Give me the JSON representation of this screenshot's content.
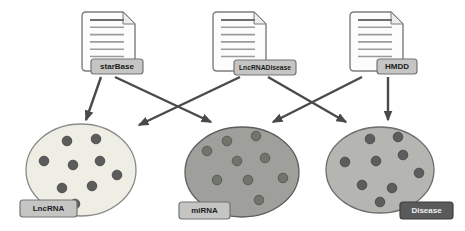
{
  "palette": {
    "background": "#ffffff",
    "arrow": "#4a4a4a",
    "doc_fill": "#fcfcfc",
    "doc_border": "#7d7d7d",
    "doc_fold_fill": "#ececec",
    "doc_line": "#9c9c9c",
    "doc_title_line": "#6f6f6f",
    "tag_light_fill": "#c5c5c3",
    "tag_light_border": "#757575",
    "tag_light_text": "#1c1c1c",
    "tag_dark_fill": "#5a5a5a",
    "tag_dark_border": "#3d3d3d",
    "tag_dark_text": "#f0f0f0"
  },
  "sources": [
    {
      "id": "starbase",
      "label": "starBase",
      "icon": "document",
      "doc": {
        "x": 82,
        "y": 12,
        "w": 53,
        "h": 59
      },
      "tag": {
        "x": 91,
        "y": 59,
        "w": 52,
        "h": 15
      }
    },
    {
      "id": "lncrnadisease",
      "label": "LncRNADisease",
      "icon": "document",
      "doc": {
        "x": 213,
        "y": 12,
        "w": 53,
        "h": 59
      },
      "tag": {
        "x": 234,
        "y": 60,
        "w": 62,
        "h": 15
      }
    },
    {
      "id": "hmdd",
      "label": "HMDD",
      "icon": "document",
      "doc": {
        "x": 350,
        "y": 12,
        "w": 53,
        "h": 59
      },
      "tag": {
        "x": 377,
        "y": 59,
        "w": 40,
        "h": 15
      }
    }
  ],
  "sets": [
    {
      "id": "lncrna",
      "label": "LncRNA",
      "tag_style": "light",
      "cx": 81,
      "cy": 170,
      "rx": 55,
      "ry": 46,
      "fill": "#efeee5",
      "stroke": "#8a8a8a",
      "dot_fill": "#5c5c5c",
      "dot_stroke": "#484848",
      "dots": [
        [
          67,
          141
        ],
        [
          96,
          139
        ],
        [
          44,
          161
        ],
        [
          73,
          165
        ],
        [
          100,
          161
        ],
        [
          117,
          175
        ],
        [
          62,
          188
        ],
        [
          92,
          186
        ],
        [
          75,
          204
        ]
      ],
      "tag": {
        "x": 20,
        "y": 200,
        "w": 57,
        "h": 17
      }
    },
    {
      "id": "mirna",
      "label": "miRNA",
      "tag_style": "light",
      "cx": 242,
      "cy": 172,
      "rx": 57,
      "ry": 45,
      "fill": "#9f9f9b",
      "stroke": "#5d5d5d",
      "dot_fill": "#70746a",
      "dot_stroke": "#545a50",
      "dots": [
        [
          227,
          141
        ],
        [
          256,
          136
        ],
        [
          207,
          151
        ],
        [
          237,
          161
        ],
        [
          265,
          158
        ],
        [
          217,
          180
        ],
        [
          248,
          180
        ],
        [
          283,
          178
        ],
        [
          259,
          200
        ]
      ],
      "tag": {
        "x": 179,
        "y": 202,
        "w": 51,
        "h": 17
      }
    },
    {
      "id": "disease",
      "label": "Disease",
      "tag_style": "dark",
      "cx": 380,
      "cy": 170,
      "rx": 54,
      "ry": 43,
      "fill": "#b5b5b2",
      "stroke": "#6d6d6d",
      "dot_fill": "#5d5d5d",
      "dot_stroke": "#484848",
      "dots": [
        [
          370,
          139
        ],
        [
          398,
          137
        ],
        [
          345,
          162
        ],
        [
          376,
          161
        ],
        [
          403,
          155
        ],
        [
          419,
          173
        ],
        [
          362,
          185
        ],
        [
          392,
          188
        ],
        [
          380,
          202
        ]
      ],
      "tag": {
        "x": 400,
        "y": 202,
        "w": 53,
        "h": 17
      }
    }
  ],
  "arrows": [
    {
      "id": "starbase-to-lncrna",
      "from": [
        101,
        77
      ],
      "to": [
        86,
        120
      ]
    },
    {
      "id": "starbase-to-mirna",
      "from": [
        115,
        77
      ],
      "to": [
        211,
        122
      ]
    },
    {
      "id": "lncrnadisease-to-lncrna",
      "from": [
        240,
        77
      ],
      "to": [
        139,
        125
      ]
    },
    {
      "id": "lncrnadisease-to-disease",
      "from": [
        268,
        77
      ],
      "to": [
        346,
        122
      ]
    },
    {
      "id": "hmdd-to-mirna",
      "from": [
        362,
        77
      ],
      "to": [
        273,
        122
      ]
    },
    {
      "id": "hmdd-to-disease",
      "from": [
        388,
        77
      ],
      "to": [
        388,
        120
      ]
    }
  ]
}
